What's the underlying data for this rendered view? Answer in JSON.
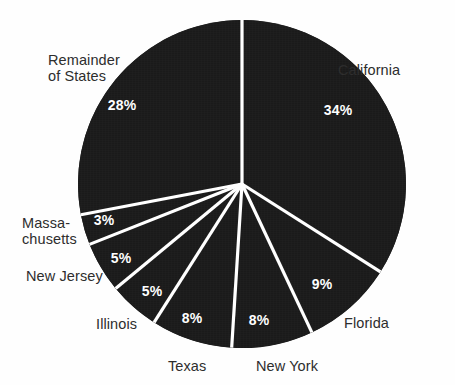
{
  "chart_data": {
    "type": "pie",
    "title": "",
    "subtitle": "",
    "xlabel": "",
    "ylabel": "",
    "legend_position": "none",
    "grid": false,
    "value_suffix": "%",
    "start_angle_deg": 0,
    "direction": "clockwise",
    "colors": {
      "slice_fill": "#1a1a1a",
      "divider": "#ffffff",
      "background": "#fefefe",
      "label_text": "#2b2b2b",
      "value_text": "#ffffff"
    },
    "categories": [
      "California",
      "Florida",
      "New York",
      "Texas",
      "Illinois",
      "New Jersey",
      "Massa-\nchusetts",
      "Remainder\nof States"
    ],
    "values": [
      34,
      9,
      8,
      8,
      5,
      5,
      3,
      28
    ],
    "value_labels": [
      "34%",
      "9%",
      "8%",
      "8%",
      "5%",
      "5%",
      "3%",
      "28%"
    ],
    "slices": [
      {
        "name": "California",
        "label": "California",
        "value": 34,
        "value_label": "34%",
        "label_x": 338,
        "label_y": 62,
        "value_x": 338,
        "value_y": 110
      },
      {
        "name": "Florida",
        "label": "Florida",
        "value": 9,
        "value_label": "9%",
        "label_x": 344,
        "label_y": 315,
        "value_x": 322,
        "value_y": 284
      },
      {
        "name": "New York",
        "label": "New York",
        "value": 8,
        "value_label": "8%",
        "label_x": 256,
        "label_y": 358,
        "value_x": 259,
        "value_y": 320
      },
      {
        "name": "Texas",
        "label": "Texas",
        "value": 8,
        "value_label": "8%",
        "label_x": 168,
        "label_y": 358,
        "value_x": 192,
        "value_y": 318
      },
      {
        "name": "Illinois",
        "label": "Illinois",
        "value": 5,
        "value_label": "5%",
        "label_x": 96,
        "label_y": 316,
        "value_x": 152,
        "value_y": 291
      },
      {
        "name": "New Jersey",
        "label": "New Jersey",
        "value": 5,
        "value_label": "5%",
        "label_x": 26,
        "label_y": 268,
        "value_x": 121,
        "value_y": 258
      },
      {
        "name": "Massachusetts",
        "label": "Massa-\nchusetts",
        "value": 3,
        "value_label": "3%",
        "label_x": 22,
        "label_y": 215,
        "value_x": 104,
        "value_y": 220
      },
      {
        "name": "Remainder of States",
        "label": "Remainder\nof States",
        "value": 28,
        "value_label": "28%",
        "label_x": 48,
        "label_y": 52,
        "value_x": 122,
        "value_y": 105
      }
    ],
    "geometry": {
      "center_x": 242,
      "center_y": 184,
      "radius": 164,
      "divider_width": 3.2
    }
  }
}
